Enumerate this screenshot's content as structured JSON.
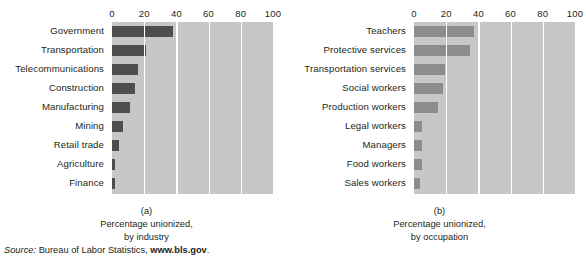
{
  "source_note": {
    "label": "Source:",
    "text": " Bureau of Labor Statistics, ",
    "url": "www.bls.gov",
    "period": "."
  },
  "panels": [
    {
      "id": "a",
      "panel_label": "(a)",
      "caption_line1": "Percentage unionized,",
      "caption_line2": "by industry",
      "bar_color": "#4e4e50"
    },
    {
      "id": "b",
      "panel_label": "(b)",
      "caption_line1": "Percentage unionized,",
      "caption_line2": "by occupation",
      "bar_color": "#8b8c8e"
    }
  ],
  "chart_data": [
    {
      "type": "bar",
      "orientation": "horizontal",
      "title": "Percentage unionized, by industry",
      "panel": "(a)",
      "xlabel": "",
      "ylabel": "",
      "xlim": [
        0,
        100
      ],
      "xticks": [
        0,
        20,
        40,
        60,
        80,
        100
      ],
      "tick_labels": [
        "0",
        "20",
        "40",
        "60",
        "80",
        "100"
      ],
      "grid": true,
      "legend": "none",
      "plot_background": "#c6c7c9",
      "bar_color": "#4e4e50",
      "categories": [
        "Government",
        "Transportation",
        "Telecommunications",
        "Construction",
        "Manufacturing",
        "Mining",
        "Retail trade",
        "Agriculture",
        "Finance"
      ],
      "values": [
        38,
        21,
        16,
        14,
        11,
        7,
        4.5,
        2,
        2
      ]
    },
    {
      "type": "bar",
      "orientation": "horizontal",
      "title": "Percentage unionized, by occupation",
      "panel": "(b)",
      "xlabel": "",
      "ylabel": "",
      "xlim": [
        0,
        100
      ],
      "xticks": [
        0,
        20,
        40,
        60,
        80,
        100
      ],
      "tick_labels": [
        "0",
        "20",
        "40",
        "60",
        "80",
        "100"
      ],
      "grid": true,
      "legend": "none",
      "plot_background": "#c6c7c9",
      "bar_color": "#8b8c8e",
      "categories": [
        "Teachers",
        "Protective services",
        "Transportation services",
        "Social workers",
        "Production workers",
        "Legal workers",
        "Managers",
        "Food workers",
        "Sales workers"
      ],
      "values": [
        37,
        35,
        19,
        18,
        15,
        5,
        5,
        5,
        4
      ]
    }
  ]
}
